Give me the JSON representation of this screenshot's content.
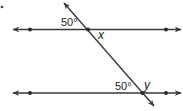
{
  "diagram": {
    "type": "parallel-lines-transversal",
    "colors": {
      "stroke": "#3a3a3a",
      "text": "#222222",
      "background": "#ffffff"
    },
    "lines": [
      {
        "id": "top-line",
        "y": 29.5,
        "x1": 12,
        "x2": 182,
        "points_x": [
          30,
          166
        ]
      },
      {
        "id": "bottom-line",
        "y": 93,
        "x1": 12,
        "x2": 182,
        "points_x": [
          30,
          166
        ]
      }
    ],
    "transversal": {
      "x1": 63,
      "y1": 2,
      "x2": 155,
      "y2": 107
    },
    "intersections": [
      {
        "id": "top-intersection",
        "x": 88,
        "y": 29.5
      },
      {
        "id": "bottom-intersection",
        "x": 143,
        "y": 93
      }
    ],
    "labels": {
      "top_angle": "50°",
      "top_variable": "x",
      "bottom_angle": "50°",
      "bottom_variable": "y"
    },
    "marker_dot": {
      "x": 2,
      "y": 7
    }
  }
}
